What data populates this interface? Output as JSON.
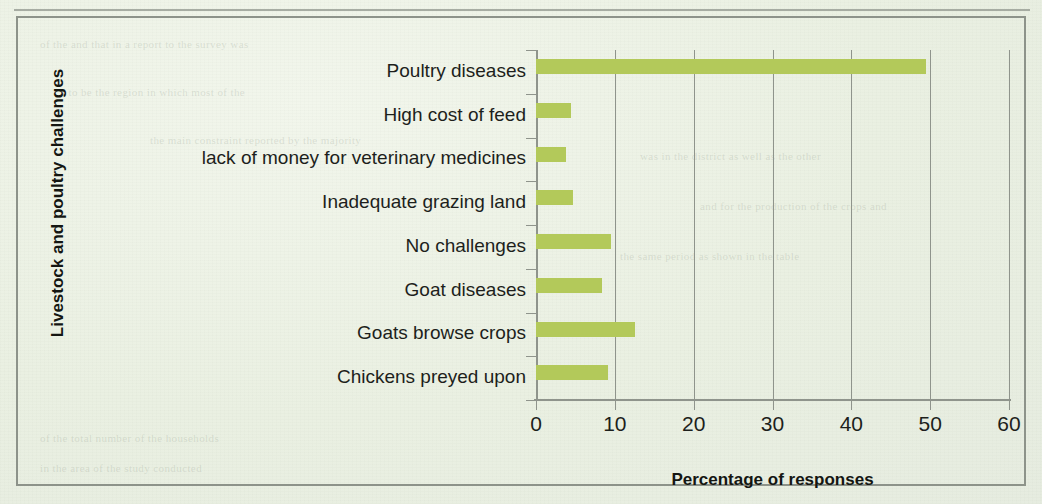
{
  "chart_data": {
    "type": "bar",
    "orientation": "horizontal",
    "title": "",
    "xlabel": "Percentage of responses",
    "ylabel": "Livestock and poultry challenges",
    "categories": [
      "Poultry diseases",
      "High cost of feed",
      "lack of money for veterinary medicines",
      "Inadequate grazing land",
      "No challenges",
      "Goat diseases",
      "Goats browse  crops",
      "Chickens preyed upon"
    ],
    "values": [
      49.5,
      4.5,
      3.8,
      4.7,
      9.5,
      8.4,
      12.6,
      9.1
    ],
    "xlim": [
      0,
      60
    ],
    "xticks": [
      0,
      10,
      20,
      30,
      40,
      50,
      60
    ],
    "xtick_labels": [
      "0",
      "10",
      "20",
      "30",
      "40",
      "50",
      "60"
    ],
    "grid": "vertical",
    "legend": "none",
    "bar_color": "#b3c95a",
    "axis_color": "#8f948c",
    "text_color": "#1d1f1c"
  },
  "page": {
    "background_color": "#eaf0e2",
    "frame_color": "#8d938a",
    "ghost_text": [
      "of the and that in a report to the survey was",
      "a to be the region in which most of the",
      "the main constraint reported by the majority",
      "was in the district as well as the other",
      "and for the production of the crops and",
      "the same period as shown in the table",
      "of the total number of the households",
      "in the area of the study conducted"
    ]
  }
}
